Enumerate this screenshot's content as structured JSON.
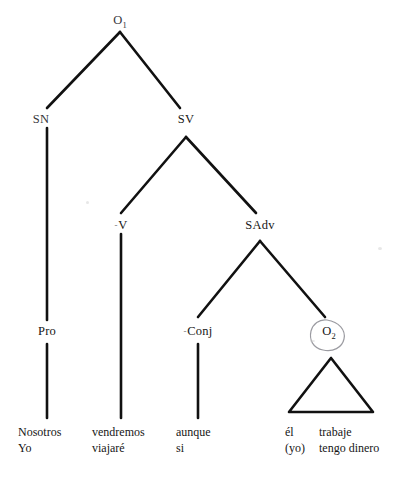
{
  "diagram": {
    "kind": "syntactic-tree",
    "language": "Spanish",
    "nodes": {
      "root": {
        "text": "O",
        "subscript": "1"
      },
      "sn": {
        "text": "SN"
      },
      "sv": {
        "text": "SV"
      },
      "v": {
        "text": "V",
        "lead_mark": "-"
      },
      "sadv": {
        "text": "SAdv"
      },
      "pro": {
        "text": "Pro"
      },
      "conj": {
        "text": "Conj",
        "lead_mark": "-"
      },
      "o2": {
        "text": "O",
        "subscript": "2",
        "circled": true
      }
    },
    "terminals": {
      "subject": {
        "line1": "Nosotros",
        "line2": "Yo"
      },
      "verb": {
        "line1": "vendremos",
        "line2": "viajaré"
      },
      "conjunction": {
        "line1": "aunque",
        "line2": "si"
      },
      "embedded_subject": {
        "line1": "él",
        "line2": "(yo)"
      },
      "embedded_predicate": {
        "line1": "trabaje",
        "line2": "tengo dinero"
      }
    },
    "colors": {
      "ink": "#161616",
      "line": "#111111",
      "highlight": "#8a8a90",
      "paper": "#ffffff"
    }
  }
}
